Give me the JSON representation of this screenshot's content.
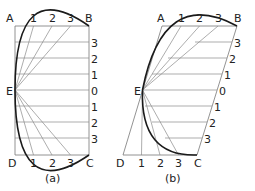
{
  "figure": {
    "panels": [
      {
        "caption": "(a)",
        "corner_labels": {
          "A": "A",
          "B": "B",
          "C": "C",
          "D": "D",
          "E": "E"
        },
        "top_divisions": [
          "1",
          "2",
          "3"
        ],
        "bottom_divisions": [
          "1",
          "2",
          "3"
        ],
        "side_divisions_upper": [
          "3",
          "2",
          "1"
        ],
        "side_center": "0",
        "side_divisions_lower": [
          "1",
          "2",
          "3"
        ]
      },
      {
        "caption": "(b)",
        "corner_labels": {
          "A": "A",
          "B": "B",
          "C": "C",
          "D": "D",
          "E": "E"
        },
        "top_divisions": [
          "1",
          "2",
          "3"
        ],
        "bottom_divisions": [
          "1",
          "2",
          "3"
        ],
        "side_divisions_upper": [
          "3",
          "2",
          "1"
        ],
        "side_center": "0",
        "side_divisions_lower": [
          "1",
          "2",
          "3"
        ]
      }
    ]
  },
  "colors": {
    "curve": "#1a1a1a",
    "construction_lines": "#8a8a8a",
    "text": "#222222"
  }
}
